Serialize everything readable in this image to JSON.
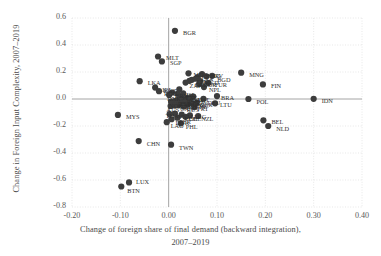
{
  "chart_data": {
    "type": "scatter",
    "title": "",
    "xlabel": "Change of foreign share of final demand (backward integration), 2007–2019",
    "xlabel_line1": "Change of foreign share of final demand (backward integration),",
    "xlabel_line2": "2007–2019",
    "ylabel": "Change in Foreign Input Complexity, 2007–2019",
    "xlim": [
      -0.2,
      0.4
    ],
    "ylim": [
      -0.8,
      0.6
    ],
    "xticks": [
      "-0.20",
      "-0.10",
      "0.00",
      "0.10",
      "0.20",
      "0.30",
      "0.40"
    ],
    "xtick_values": [
      -0.2,
      -0.1,
      0.0,
      0.1,
      0.2,
      0.3,
      0.4
    ],
    "yticks": [
      "0.6",
      "0.4",
      "0.2",
      "0.0",
      "-0.2",
      "-0.4",
      "-0.6",
      "-0.8"
    ],
    "ytick_values": [
      0.6,
      0.4,
      0.2,
      0.0,
      -0.2,
      -0.4,
      -0.6,
      -0.8
    ],
    "grid": true,
    "grid_style": "dotted",
    "legend": "none",
    "marker_color": "#3d3d3d",
    "marker_size": 3.1,
    "zero_line_color": "#9a9a9a",
    "grid_color": "#d8d8d8",
    "points": [
      {
        "label": "BGR",
        "x": 0.013,
        "y": 0.505
      },
      {
        "label": "MLT",
        "x": -0.022,
        "y": 0.315
      },
      {
        "label": "SGP",
        "x": -0.014,
        "y": 0.278
      },
      {
        "label": "MNG",
        "x": 0.15,
        "y": 0.195
      },
      {
        "label": "MDA",
        "x": 0.041,
        "y": 0.19
      },
      {
        "label": "HKG",
        "x": 0.069,
        "y": 0.185
      },
      {
        "label": "BGD",
        "x": 0.09,
        "y": 0.172
      },
      {
        "label": "HRV",
        "x": 0.078,
        "y": 0.168
      },
      {
        "label": "LVA",
        "x": 0.06,
        "y": 0.162
      },
      {
        "label": "EST",
        "x": 0.056,
        "y": 0.15
      },
      {
        "label": "ITA",
        "x": 0.048,
        "y": 0.142
      },
      {
        "label": "GRC",
        "x": 0.043,
        "y": 0.135
      },
      {
        "label": "MKD",
        "x": 0.065,
        "y": 0.132
      },
      {
        "label": "LKA",
        "x": -0.06,
        "y": 0.132
      },
      {
        "label": "ZAF",
        "x": 0.035,
        "y": 0.122
      },
      {
        "label": "TUR",
        "x": 0.082,
        "y": 0.118
      },
      {
        "label": "KOR",
        "x": 0.063,
        "y": 0.112
      },
      {
        "label": "FIN",
        "x": 0.195,
        "y": 0.108
      },
      {
        "label": "NPL",
        "x": 0.073,
        "y": 0.088
      },
      {
        "label": "IRL",
        "x": -0.028,
        "y": 0.085
      },
      {
        "label": "KGZ",
        "x": 0.022,
        "y": 0.072
      },
      {
        "label": "ROU",
        "x": -0.02,
        "y": 0.058
      },
      {
        "label": "BRN",
        "x": 0.007,
        "y": 0.048
      },
      {
        "label": "ISL",
        "x": 0.03,
        "y": 0.042
      },
      {
        "label": "SVN",
        "x": 0.018,
        "y": 0.038
      },
      {
        "label": "DNK",
        "x": 0.001,
        "y": 0.03
      },
      {
        "label": "CZE",
        "x": 0.026,
        "y": 0.025
      },
      {
        "label": "BRA",
        "x": 0.1,
        "y": 0.022
      },
      {
        "label": "AUT",
        "x": 0.051,
        "y": 0.018
      },
      {
        "label": "SWE",
        "x": 0.047,
        "y": 0.014
      },
      {
        "label": "IND",
        "x": 0.038,
        "y": 0.008
      },
      {
        "label": "DEU",
        "x": 0.072,
        "y": 0.002
      },
      {
        "label": "IDN",
        "x": 0.3,
        "y": 0.001
      },
      {
        "label": "POL",
        "x": 0.165,
        "y": 0.0
      },
      {
        "label": "JPN",
        "x": 0.03,
        "y": -0.004
      },
      {
        "label": "ESP",
        "x": 0.019,
        "y": -0.008
      },
      {
        "label": "FRA",
        "x": 0.043,
        "y": -0.012
      },
      {
        "label": "USA",
        "x": 0.013,
        "y": -0.016
      },
      {
        "label": "NOR",
        "x": 0.005,
        "y": -0.02
      },
      {
        "label": "HUN",
        "x": 0.034,
        "y": -0.024
      },
      {
        "label": "GBR",
        "x": 0.058,
        "y": -0.028
      },
      {
        "label": "CHE",
        "x": 0.048,
        "y": -0.032
      },
      {
        "label": "LTU",
        "x": 0.096,
        "y": -0.032
      },
      {
        "label": "NLD",
        "x": 0.026,
        "y": -0.036
      },
      {
        "label": "MEX",
        "x": 0.04,
        "y": -0.04
      },
      {
        "label": "CAN",
        "x": 0.02,
        "y": -0.044
      },
      {
        "label": "SVK",
        "x": 0.012,
        "y": -0.048
      },
      {
        "label": "AUS",
        "x": 0.004,
        "y": -0.052
      },
      {
        "label": "RUS",
        "x": 0.031,
        "y": -0.056
      },
      {
        "label": "PRT",
        "x": 0.053,
        "y": -0.06
      },
      {
        "label": "MYS",
        "x": -0.105,
        "y": -0.118
      },
      {
        "label": "VNM",
        "x": 0.013,
        "y": -0.108
      },
      {
        "label": "THA",
        "x": 0.002,
        "y": -0.112
      },
      {
        "label": "COL",
        "x": 0.027,
        "y": -0.116
      },
      {
        "label": "ARG",
        "x": 0.044,
        "y": -0.122
      },
      {
        "label": "NZL",
        "x": 0.061,
        "y": -0.126
      },
      {
        "label": "CHL",
        "x": 0.035,
        "y": -0.132
      },
      {
        "label": "PER",
        "x": 0.018,
        "y": -0.138
      },
      {
        "label": "BEL",
        "x": 0.196,
        "y": -0.158
      },
      {
        "label": "DNK2",
        "x": 0.006,
        "y": -0.15
      },
      {
        "label": "LAO",
        "x": -0.004,
        "y": -0.172
      },
      {
        "label": "PHL",
        "x": 0.025,
        "y": -0.18
      },
      {
        "label": "NLD2",
        "x": 0.206,
        "y": -0.2
      },
      {
        "label": "CHN",
        "x": -0.062,
        "y": -0.312
      },
      {
        "label": "TWN",
        "x": 0.005,
        "y": -0.338
      },
      {
        "label": "LUX",
        "x": -0.082,
        "y": -0.618
      },
      {
        "label": "BTN",
        "x": -0.098,
        "y": -0.648
      }
    ],
    "annotated_labels": [
      {
        "text": "BGR",
        "x": 0.013,
        "y": 0.505,
        "dx": 8,
        "dy": 2
      },
      {
        "text": "MLT",
        "x": -0.022,
        "y": 0.315,
        "dx": 8,
        "dy": 2
      },
      {
        "text": "SGP",
        "x": -0.014,
        "y": 0.278,
        "dx": 8,
        "dy": 2
      },
      {
        "text": "MNG",
        "x": 0.15,
        "y": 0.195,
        "dx": 8,
        "dy": 2
      },
      {
        "text": "MDA",
        "x": 0.041,
        "y": 0.19,
        "dx": 5,
        "dy": 2
      },
      {
        "text": "HKG",
        "x": 0.069,
        "y": 0.185,
        "dx": 5,
        "dy": 2
      },
      {
        "text": "BGD",
        "x": 0.09,
        "y": 0.172,
        "dx": 5,
        "dy": 4
      },
      {
        "text": "HRV",
        "x": 0.078,
        "y": 0.168,
        "dx": 4,
        "dy": 0
      },
      {
        "text": "LVA",
        "x": 0.06,
        "y": 0.162,
        "dx": 4,
        "dy": 2
      },
      {
        "text": "EST",
        "x": 0.056,
        "y": 0.15,
        "dx": 5,
        "dy": 3
      },
      {
        "text": "ITA",
        "x": 0.048,
        "y": 0.142,
        "dx": 5,
        "dy": 2
      },
      {
        "text": "GRC",
        "x": 0.043,
        "y": 0.135,
        "dx": 5,
        "dy": 4
      },
      {
        "text": "MKD",
        "x": 0.065,
        "y": 0.132,
        "dx": 4,
        "dy": 2
      },
      {
        "text": "LKA",
        "x": -0.06,
        "y": 0.132,
        "dx": 8,
        "dy": 2
      },
      {
        "text": "ZAF",
        "x": 0.035,
        "y": 0.122,
        "dx": 4,
        "dy": 3
      },
      {
        "text": "TUR",
        "x": 0.082,
        "y": 0.118,
        "dx": 6,
        "dy": 2
      },
      {
        "text": "KOR",
        "x": 0.063,
        "y": 0.112,
        "dx": 4,
        "dy": 1
      },
      {
        "text": "FIN",
        "x": 0.195,
        "y": 0.108,
        "dx": 8,
        "dy": 2
      },
      {
        "text": "NPL",
        "x": 0.073,
        "y": 0.088,
        "dx": 5,
        "dy": 3
      },
      {
        "text": "IRL",
        "x": -0.028,
        "y": 0.085,
        "dx": 7,
        "dy": 2
      },
      {
        "text": "KGZ",
        "x": 0.022,
        "y": 0.072,
        "dx": -16,
        "dy": 2
      },
      {
        "text": "ROU",
        "x": -0.02,
        "y": 0.058,
        "dx": 5,
        "dy": 3
      },
      {
        "text": "BRN",
        "x": 0.007,
        "y": 0.048,
        "dx": 3,
        "dy": 3
      },
      {
        "text": "ISL",
        "x": 0.03,
        "y": 0.042,
        "dx": 3,
        "dy": 2
      },
      {
        "text": "SVN",
        "x": 0.018,
        "y": 0.038,
        "dx": 4,
        "dy": 4
      },
      {
        "text": "DNK",
        "x": 0.001,
        "y": 0.03,
        "dx": -2,
        "dy": 4
      },
      {
        "text": "CZE",
        "x": 0.026,
        "y": 0.025,
        "dx": 4,
        "dy": 2
      },
      {
        "text": "BRA",
        "x": 0.1,
        "y": 0.022,
        "dx": 4,
        "dy": 2
      },
      {
        "text": "AUT",
        "x": 0.051,
        "y": 0.018,
        "dx": 3,
        "dy": 3
      },
      {
        "text": "SWE",
        "x": 0.047,
        "y": 0.014,
        "dx": 3,
        "dy": 4
      },
      {
        "text": "IND",
        "x": 0.038,
        "y": 0.008,
        "dx": 4,
        "dy": 2
      },
      {
        "text": "DEU",
        "x": 0.072,
        "y": 0.002,
        "dx": 4,
        "dy": 4
      },
      {
        "text": "IDN",
        "x": 0.3,
        "y": 0.001,
        "dx": 8,
        "dy": 2
      },
      {
        "text": "POL",
        "x": 0.165,
        "y": 0.0,
        "dx": 8,
        "dy": 3
      },
      {
        "text": "JPN",
        "x": 0.03,
        "y": -0.004,
        "dx": 3,
        "dy": 2
      },
      {
        "text": "ESP",
        "x": 0.019,
        "y": -0.008,
        "dx": 2,
        "dy": 4
      },
      {
        "text": "FRA",
        "x": 0.043,
        "y": -0.012,
        "dx": 3,
        "dy": 2
      },
      {
        "text": "USA",
        "x": 0.013,
        "y": -0.016,
        "dx": 3,
        "dy": 3
      },
      {
        "text": "NOR",
        "x": 0.005,
        "y": -0.02,
        "dx": -2,
        "dy": 4
      },
      {
        "text": "HUN",
        "x": 0.034,
        "y": -0.024,
        "dx": 3,
        "dy": 3
      },
      {
        "text": "GBR",
        "x": 0.058,
        "y": -0.028,
        "dx": 3,
        "dy": 2
      },
      {
        "text": "CHE",
        "x": 0.048,
        "y": -0.032,
        "dx": 3,
        "dy": 4
      },
      {
        "text": "LTU",
        "x": 0.096,
        "y": -0.032,
        "dx": 5,
        "dy": 2
      },
      {
        "text": "NLD",
        "x": 0.026,
        "y": -0.036,
        "dx": 3,
        "dy": 3
      },
      {
        "text": "MEX",
        "x": 0.04,
        "y": -0.04,
        "dx": 3,
        "dy": 2
      },
      {
        "text": "CAN",
        "x": 0.02,
        "y": -0.044,
        "dx": 2,
        "dy": 4
      },
      {
        "text": "SVK",
        "x": 0.012,
        "y": -0.048,
        "dx": 3,
        "dy": 2
      },
      {
        "text": "AUS",
        "x": 0.004,
        "y": -0.052,
        "dx": -4,
        "dy": 4
      },
      {
        "text": "RUS",
        "x": 0.031,
        "y": -0.056,
        "dx": 3,
        "dy": 3
      },
      {
        "text": "PRT",
        "x": 0.053,
        "y": -0.06,
        "dx": 3,
        "dy": 2
      },
      {
        "text": "MYS",
        "x": -0.105,
        "y": -0.118,
        "dx": 8,
        "dy": 2
      },
      {
        "text": "VNM",
        "x": 0.013,
        "y": -0.108,
        "dx": 3,
        "dy": 3
      },
      {
        "text": "THA",
        "x": 0.002,
        "y": -0.112,
        "dx": -4,
        "dy": 2
      },
      {
        "text": "COL",
        "x": 0.027,
        "y": -0.116,
        "dx": 3,
        "dy": 4
      },
      {
        "text": "ARG",
        "x": 0.044,
        "y": -0.122,
        "dx": 3,
        "dy": 2
      },
      {
        "text": "NZL",
        "x": 0.061,
        "y": -0.126,
        "dx": 3,
        "dy": 3
      },
      {
        "text": "CHL",
        "x": 0.035,
        "y": -0.132,
        "dx": 3,
        "dy": 2
      },
      {
        "text": "PER",
        "x": 0.018,
        "y": -0.138,
        "dx": 2,
        "dy": 4
      },
      {
        "text": "BEL",
        "x": 0.196,
        "y": -0.158,
        "dx": 8,
        "dy": 2
      },
      {
        "text": "DNK",
        "x": 0.006,
        "y": -0.15,
        "dx": 4,
        "dy": 4
      },
      {
        "text": "LAO",
        "x": -0.004,
        "y": -0.172,
        "dx": 4,
        "dy": 4
      },
      {
        "text": "PHL",
        "x": 0.025,
        "y": -0.18,
        "dx": 5,
        "dy": 4
      },
      {
        "text": "NLD",
        "x": 0.206,
        "y": -0.2,
        "dx": 8,
        "dy": 3
      },
      {
        "text": "CHN",
        "x": -0.062,
        "y": -0.312,
        "dx": 8,
        "dy": 3
      },
      {
        "text": "TWN",
        "x": 0.005,
        "y": -0.338,
        "dx": 8,
        "dy": 3
      },
      {
        "text": "LUX",
        "x": -0.082,
        "y": -0.618,
        "dx": 7,
        "dy": 0
      },
      {
        "text": "BTN",
        "x": -0.098,
        "y": -0.648,
        "dx": 6,
        "dy": 5
      }
    ]
  }
}
